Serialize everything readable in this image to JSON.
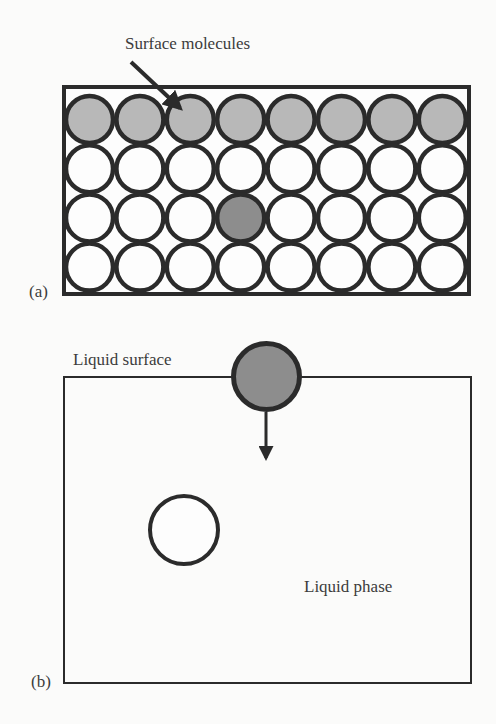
{
  "panel_a": {
    "label": "(a)",
    "annotation": "Surface molecules",
    "grid": {
      "rows": 4,
      "cols": 8,
      "surface_row": 0,
      "highlighted_cell": {
        "row": 2,
        "col": 3
      }
    }
  },
  "panel_b": {
    "label": "(b)",
    "surface_label": "Liquid surface",
    "bulk_label": "Liquid phase"
  },
  "colors": {
    "stroke": "#2b2b2b",
    "surface_fill": "#b8b8b8",
    "highlight_fill": "#8d8d8d",
    "plain_fill": "#fdfdfd",
    "background": "#fbfbfa"
  }
}
